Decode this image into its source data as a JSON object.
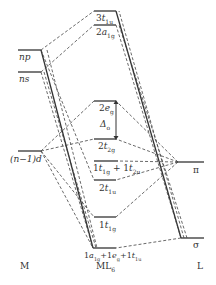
{
  "columns": {
    "metal": "M",
    "complex": "ML",
    "complex_sub": "6",
    "ligand": "L"
  },
  "metal_levels": [
    {
      "id": "np",
      "label": "np",
      "y": 50
    },
    {
      "id": "ns",
      "label": "ns",
      "y": 72
    },
    {
      "id": "d",
      "label": "(n−1)d",
      "y": 151
    }
  ],
  "complex_levels": [
    {
      "id": "3t1u",
      "num": "3",
      "sym": "t",
      "sub": "1u",
      "y": 11
    },
    {
      "id": "2a1g",
      "num": "2",
      "sym": "a",
      "sub": "1g",
      "y": 25
    },
    {
      "id": "2eg",
      "num": "2",
      "sym": "e",
      "sub": "g",
      "y": 101
    },
    {
      "id": "2t2g",
      "num": "2",
      "sym": "t",
      "sub": "2g",
      "y": 139
    },
    {
      "id": "1t1g_1t2u",
      "text": "1t1g + 1t2u",
      "y": 161
    },
    {
      "id": "2t1u",
      "num": "2",
      "sym": "t",
      "sub": "1u",
      "y": 180
    },
    {
      "id": "1t1g",
      "num": "1",
      "sym": "t",
      "sub": "1g",
      "y": 217
    },
    {
      "id": "bonding",
      "text": "1a1g+1eg+1t1u",
      "y": 248
    }
  ],
  "ligand_levels": [
    {
      "id": "pi",
      "label": "π",
      "y": 162
    },
    {
      "id": "sigma",
      "label": "σ",
      "y": 238
    }
  ],
  "splitting_label": "Δ",
  "splitting_sub": "o"
}
